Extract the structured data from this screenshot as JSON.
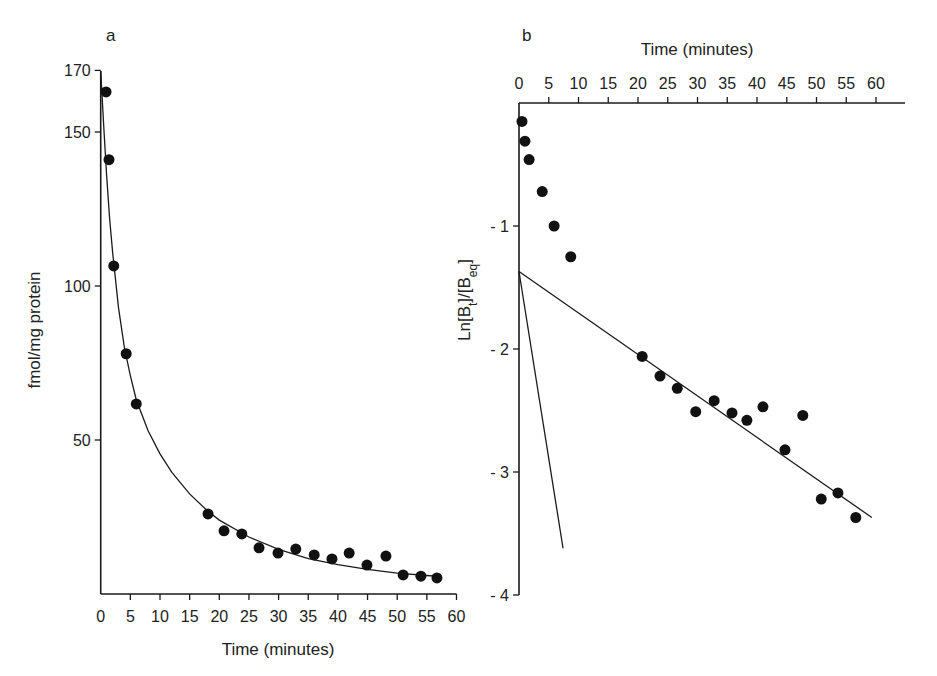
{
  "chart_data": [
    {
      "panel": "a",
      "type": "scatter",
      "title": "",
      "xlabel": "Time (minutes)",
      "ylabel": "fmol/mg protein",
      "xlim": [
        0,
        60
      ],
      "ylim": [
        0,
        170
      ],
      "x_ticks": [
        0,
        5,
        10,
        15,
        20,
        25,
        30,
        35,
        40,
        45,
        50,
        55,
        60
      ],
      "y_ticks": [
        50,
        100,
        150,
        170
      ],
      "grid": false,
      "series": [
        {
          "name": "binding",
          "marker": "filled-circle",
          "x": [
            0.9,
            1.4,
            2.2,
            4.3,
            6.0,
            18.1,
            20.8,
            23.8,
            26.7,
            29.9,
            32.9,
            36.0,
            39.0,
            41.9,
            44.9,
            48.1,
            51.0,
            54.0,
            56.7
          ],
          "y": [
            163,
            141,
            106.5,
            78,
            61.7,
            26,
            20.5,
            19.5,
            15,
            13.3,
            14.6,
            12.7,
            11.4,
            13.3,
            9.4,
            12.3,
            6.2,
            5.8,
            5.2
          ]
        },
        {
          "name": "fitted curve (biexponential decay)",
          "type": "line",
          "x": [
            0,
            0.5,
            1,
            1.5,
            2,
            3,
            4,
            5,
            6,
            8,
            10,
            12,
            15,
            18,
            20,
            25,
            30,
            35,
            40,
            45,
            50,
            55,
            57
          ],
          "y": [
            170,
            152,
            136,
            122,
            111,
            93,
            80,
            71,
            63,
            53,
            45.5,
            39.5,
            32.5,
            27,
            24,
            18.5,
            14.5,
            11.5,
            9.5,
            8,
            6.8,
            6,
            5.7
          ]
        }
      ]
    },
    {
      "panel": "b",
      "type": "scatter",
      "title": "",
      "xlabel": "Time (minutes)",
      "xlabel_position": "top",
      "ylabel": "Ln[Bt]/[Beq]",
      "xlim": [
        0,
        65
      ],
      "ylim": [
        -4,
        0
      ],
      "x_ticks": [
        0,
        5,
        10,
        15,
        20,
        25,
        30,
        35,
        40,
        45,
        50,
        55,
        60
      ],
      "y_ticks": [
        -1,
        -2,
        -3,
        -4
      ],
      "grid": false,
      "series": [
        {
          "name": "ln ratio",
          "marker": "filled-circle",
          "x": [
            0.5,
            1.0,
            1.7,
            3.9,
            5.9,
            8.7,
            20.7,
            23.7,
            26.6,
            29.7,
            32.8,
            35.8,
            38.3,
            41.0,
            44.7,
            47.7,
            50.8,
            53.6,
            56.6
          ],
          "y": [
            -0.15,
            -0.31,
            -0.46,
            -0.72,
            -1.0,
            -1.25,
            -2.06,
            -2.22,
            -2.32,
            -2.51,
            -2.42,
            -2.52,
            -2.58,
            -2.47,
            -2.82,
            -2.54,
            -3.22,
            -3.17,
            -3.37
          ]
        },
        {
          "name": "slow component fit",
          "type": "line",
          "x": [
            0,
            59.3
          ],
          "y": [
            -1.37,
            -3.37
          ]
        },
        {
          "name": "fast component fit",
          "type": "line",
          "x": [
            0,
            7.4
          ],
          "y": [
            -1.37,
            -3.62
          ]
        }
      ]
    }
  ],
  "panels": {
    "a": {
      "label": "a",
      "xlabel": "Time (minutes)",
      "ylabel": "fmol/mg protein"
    },
    "b": {
      "label": "b",
      "xlabel": "Time (minutes)",
      "ylabel_main": "Ln[B",
      "ylabel_sub1": "t",
      "ylabel_mid": "]/[B",
      "ylabel_sub2": "eq",
      "ylabel_end": "]"
    }
  }
}
